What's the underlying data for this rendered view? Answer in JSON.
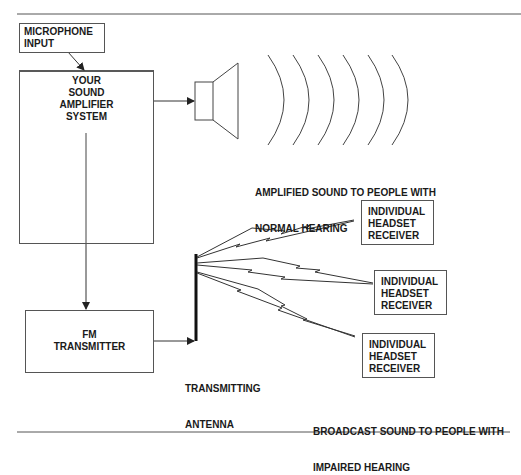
{
  "diagram": {
    "microphone_box": {
      "lines": [
        "MICROPHONE",
        "INPUT"
      ]
    },
    "amplifier_box": {
      "lines": [
        "YOUR",
        "SOUND",
        "AMPLIFIER",
        "SYSTEM"
      ]
    },
    "speaker_label": {
      "lines": [
        "AMPLIFIED SOUND TO PEOPLE WITH",
        "NORMAL HEARING"
      ]
    },
    "fm_box": {
      "lines": [
        "FM",
        "TRANSMITTER"
      ]
    },
    "antenna_label": {
      "lines": [
        "TRANSMITTING",
        "ANTENNA"
      ]
    },
    "receivers": [
      {
        "lines": [
          "INDIVIDUAL",
          "HEADSET",
          "RECEIVER"
        ]
      },
      {
        "lines": [
          "INDIVIDUAL",
          "HEADSET",
          "RECEIVER"
        ]
      },
      {
        "lines": [
          "INDIVIDUAL",
          "HEADSET",
          "RECEIVER"
        ]
      }
    ],
    "broadcast_label": {
      "lines": [
        "BROADCAST SOUND TO PEOPLE WITH",
        "IMPAIRED HEARING"
      ]
    },
    "icons": [
      "speaker-icon",
      "sound-wave-icon",
      "antenna-icon",
      "radio-signal-icon"
    ],
    "colors": {
      "line": "#444444",
      "text": "#1a1a1a",
      "background": "#ffffff"
    }
  }
}
